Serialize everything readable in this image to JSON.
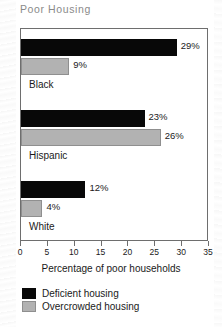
{
  "title": "Poor Housing",
  "chart_data": {
    "type": "bar",
    "orientation": "horizontal",
    "title": "Poor Housing",
    "xlabel": "Percentage of poor households",
    "ylabel": "",
    "xlim": [
      0,
      35
    ],
    "xticks": [
      0,
      5,
      10,
      15,
      20,
      25,
      30,
      35
    ],
    "grid": false,
    "legend_position": "bottom-left",
    "categories": [
      "Black",
      "Hispanic",
      "White"
    ],
    "series": [
      {
        "name": "Deficient housing",
        "color": "#080808",
        "values": [
          29,
          23,
          12
        ],
        "labels": [
          "29%",
          "23%",
          "12%"
        ]
      },
      {
        "name": "Overcrowded housing",
        "color": "#b2b2b2",
        "values": [
          9,
          26,
          4
        ],
        "labels": [
          "9%",
          "26%",
          "4%"
        ]
      }
    ]
  },
  "axis": {
    "tick_labels": [
      "0",
      "5",
      "10",
      "15",
      "20",
      "25",
      "30",
      "35"
    ],
    "title": "Percentage of poor households"
  },
  "legend": {
    "items": [
      {
        "label": "Deficient housing",
        "swatch": "deficient"
      },
      {
        "label": "Overcrowded housing",
        "swatch": "overcrowded"
      }
    ]
  },
  "groups": [
    {
      "label": "Black",
      "deficient_value": 29,
      "deficient_label": "29%",
      "overcrowded_value": 9,
      "overcrowded_label": "9%"
    },
    {
      "label": "Hispanic",
      "deficient_value": 23,
      "deficient_label": "23%",
      "overcrowded_value": 26,
      "overcrowded_label": "26%"
    },
    {
      "label": "White",
      "deficient_value": 12,
      "deficient_label": "12%",
      "overcrowded_value": 4,
      "overcrowded_label": "4%"
    }
  ]
}
